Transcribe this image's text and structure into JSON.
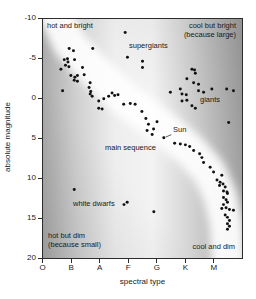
{
  "chart_data": {
    "type": "scatter",
    "title": "",
    "xlabel": "spectral type",
    "ylabel": "absolute magnitude",
    "x_axis": {
      "label": "spectral type",
      "categories": [
        "O",
        "B",
        "A",
        "F",
        "G",
        "K",
        "M"
      ],
      "positions": [
        0,
        1,
        2,
        3,
        4,
        5,
        6
      ],
      "range": [
        0,
        7
      ]
    },
    "y_axis": {
      "label": "absolute magnitude",
      "ticks": [
        -10,
        -5,
        0,
        5,
        10,
        15,
        20
      ],
      "range": [
        -10,
        20
      ],
      "direction": "inverted (brightest / most negative at top)"
    },
    "labels": {
      "hot_bright": "hot and bright",
      "cool_bright_1": "cool but bright",
      "cool_bright_2": "(because large)",
      "supergiants": "supergiants",
      "giants": "giants",
      "sun": "Sun",
      "main_sequence": "main sequence",
      "white_dwarfs": "white dwarfs",
      "hot_dim_1": "hot but dim",
      "hot_dim_2": "(because small)",
      "cool_dim": "cool and dim"
    },
    "series": [
      {
        "name": "supergiants",
        "points": [
          [
            2.89,
            -8.3
          ],
          [
            1.75,
            -6.3
          ],
          [
            2.97,
            -5.2
          ],
          [
            3.5,
            -4.7
          ],
          [
            3.5,
            -3.9
          ]
        ]
      },
      {
        "name": "main sequence upper (O-B-A)",
        "points": [
          [
            0.63,
            -3.7
          ],
          [
            0.69,
            -1.0
          ],
          [
            0.75,
            -4.9
          ],
          [
            0.79,
            -4.2
          ],
          [
            0.86,
            -5.0
          ],
          [
            0.88,
            -4.6
          ],
          [
            0.91,
            -4.0
          ],
          [
            0.92,
            -6.3
          ],
          [
            0.98,
            -2.9
          ],
          [
            1.07,
            -6.0
          ],
          [
            1.1,
            -2.3
          ],
          [
            1.11,
            -4.9
          ],
          [
            1.12,
            -2.7
          ],
          [
            1.21,
            -2.9
          ],
          [
            1.21,
            -2.2
          ],
          [
            1.39,
            -3.9
          ],
          [
            1.45,
            -3.0
          ],
          [
            1.62,
            -1.4
          ],
          [
            1.66,
            -2.0
          ],
          [
            1.66,
            -0.6
          ],
          [
            1.68,
            -0.9
          ],
          [
            1.73,
            -0.3
          ]
        ]
      },
      {
        "name": "main sequence middle (A-F-G)",
        "points": [
          [
            1.96,
            0.3
          ],
          [
            1.96,
            1.2
          ],
          [
            2.08,
            1.3
          ],
          [
            2.14,
            0.0
          ],
          [
            2.31,
            -0.3
          ],
          [
            2.43,
            -0.7
          ],
          [
            2.52,
            -0.4
          ],
          [
            2.64,
            -0.5
          ],
          [
            2.84,
            0.7
          ],
          [
            3.07,
            0.6
          ],
          [
            3.24,
            0.7
          ],
          [
            3.48,
            1.6
          ],
          [
            3.62,
            2.5
          ],
          [
            3.66,
            4.0
          ],
          [
            3.71,
            3.2
          ],
          [
            3.84,
            4.5
          ],
          [
            3.89,
            3.8
          ],
          [
            4.01,
            2.9
          ]
        ]
      },
      {
        "name": "Sun",
        "points": [
          [
            4.25,
            4.9
          ]
        ]
      },
      {
        "name": "main sequence lower (K-M)",
        "points": [
          [
            4.63,
            5.6
          ],
          [
            4.83,
            5.7
          ],
          [
            5.01,
            5.8
          ],
          [
            5.16,
            6.0
          ],
          [
            5.3,
            6.5
          ],
          [
            5.51,
            6.9
          ],
          [
            5.59,
            7.4
          ],
          [
            5.65,
            8.0
          ],
          [
            5.88,
            8.6
          ],
          [
            6.0,
            9.2
          ],
          [
            6.12,
            10.2
          ],
          [
            6.21,
            10.9
          ],
          [
            6.23,
            10.5
          ],
          [
            6.29,
            9.6
          ],
          [
            6.33,
            10.7
          ],
          [
            6.35,
            11.6
          ],
          [
            6.35,
            12.4
          ],
          [
            6.35,
            13.3
          ],
          [
            6.41,
            11.1
          ],
          [
            6.41,
            14.6
          ],
          [
            6.44,
            12.7
          ],
          [
            6.44,
            13.7
          ],
          [
            6.47,
            11.7
          ],
          [
            6.49,
            11.9
          ],
          [
            6.49,
            13.0
          ],
          [
            6.49,
            14.9
          ],
          [
            6.49,
            15.7
          ],
          [
            6.49,
            16.4
          ],
          [
            6.56,
            13.9
          ],
          [
            6.56,
            15.3
          ],
          [
            6.56,
            16.0
          ],
          [
            6.7,
            14.0
          ],
          [
            6.29,
            13.8
          ]
        ]
      },
      {
        "name": "giants",
        "points": [
          [
            4.48,
            -0.8
          ],
          [
            4.83,
            -1.2
          ],
          [
            4.89,
            -0.6
          ],
          [
            4.89,
            0.3
          ],
          [
            5.04,
            -0.5
          ],
          [
            5.06,
            -2.5
          ],
          [
            5.06,
            0.2
          ],
          [
            5.24,
            -3.7
          ],
          [
            5.24,
            0.9
          ],
          [
            5.3,
            -2.0
          ],
          [
            5.33,
            -3.6
          ],
          [
            5.36,
            -3.2
          ],
          [
            5.36,
            1.2
          ],
          [
            5.47,
            -1.8
          ],
          [
            5.47,
            -1.0
          ],
          [
            5.65,
            -0.8
          ],
          [
            5.94,
            -1.2
          ],
          [
            6.46,
            -1.2
          ],
          [
            6.7,
            -1.0
          ],
          [
            6.53,
            3.0
          ]
        ]
      },
      {
        "name": "white dwarfs",
        "points": [
          [
            1.1,
            11.4
          ],
          [
            2.85,
            13.3
          ],
          [
            2.96,
            13.0
          ],
          [
            3.9,
            14.2
          ]
        ]
      }
    ],
    "colors": {
      "dot": "#111111",
      "band": "#ffffff",
      "bg_left": "#ababab",
      "bg_center": "#f3f3f3",
      "bg_right": "#a2a2a2",
      "text": "#1a1a1a"
    },
    "layout_hints": {
      "grid": "off",
      "main_sequence_band": "light diagonal band from upper-left to lower-right",
      "legend": "none (region labels annotated inside plot)"
    }
  }
}
